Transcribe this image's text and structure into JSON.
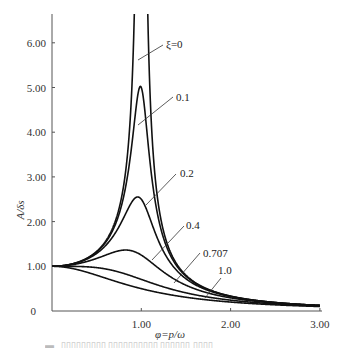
{
  "chart_data": {
    "type": "line",
    "title": "",
    "xlabel": "φ=p/ω",
    "ylabel": "A/δs",
    "xlim": [
      0,
      3.0
    ],
    "ylim": [
      0,
      6.6
    ],
    "x_ticks": [
      "1.00",
      "2.00",
      "3.00"
    ],
    "y_ticks": [
      "0",
      "1.00",
      "2.00",
      "3.00",
      "4.00",
      "5.00",
      "6.00"
    ],
    "grid": false,
    "legend": "inline leader-line labels",
    "formula": "A/δs = 1 / sqrt((1-φ²)² + (2ζφ)²)",
    "series": [
      {
        "name": "ξ=0",
        "zeta": 0,
        "peak": "∞ at φ=1.00",
        "sample": {
          "x": [
            0,
            0.5,
            0.9,
            1.1,
            1.5,
            2.0,
            3.0
          ],
          "y": [
            1.0,
            1.33,
            5.26,
            4.76,
            0.8,
            0.33,
            0.125
          ]
        }
      },
      {
        "name": "0.1",
        "zeta": 0.1,
        "peak": 5.03,
        "sample": {
          "x": [
            0,
            0.5,
            0.99,
            1.5,
            2.0,
            3.0
          ],
          "y": [
            1.0,
            1.32,
            5.03,
            0.78,
            0.33,
            0.125
          ]
        }
      },
      {
        "name": "0.2",
        "zeta": 0.2,
        "peak": 2.55,
        "sample": {
          "x": [
            0,
            0.5,
            0.96,
            1.5,
            2.0,
            3.0
          ],
          "y": [
            1.0,
            1.29,
            2.55,
            0.75,
            0.32,
            0.124
          ]
        }
      },
      {
        "name": "0.4",
        "zeta": 0.4,
        "peak": 1.36,
        "sample": {
          "x": [
            0,
            0.5,
            0.82,
            1.5,
            2.0,
            3.0
          ],
          "y": [
            1.0,
            1.18,
            1.36,
            0.64,
            0.3,
            0.12
          ]
        }
      },
      {
        "name": "0.707",
        "zeta": 0.707,
        "peak": 1.0,
        "sample": {
          "x": [
            0,
            0.5,
            1.0,
            1.5,
            2.0,
            3.0
          ],
          "y": [
            1.0,
            0.97,
            0.71,
            0.41,
            0.24,
            0.11
          ]
        }
      },
      {
        "name": "1.0",
        "zeta": 1.0,
        "peak": 1.0,
        "sample": {
          "x": [
            0,
            0.5,
            1.0,
            1.5,
            2.0,
            3.0
          ],
          "y": [
            1.0,
            0.8,
            0.5,
            0.31,
            0.2,
            0.1
          ]
        }
      }
    ]
  },
  "labels": {
    "y_axis_title": "A/δs",
    "x_axis_title": "φ=p/ω",
    "curve_labels": [
      "ξ=0",
      "0.1",
      "0.2",
      "0.4",
      "0.707",
      "1.0"
    ],
    "y_ticks": [
      "0",
      "1.00",
      "2.00",
      "3.00",
      "4.00",
      "5.00",
      "6.00"
    ],
    "x_ticks": [
      "1.00",
      "2.00",
      "3.00"
    ]
  }
}
